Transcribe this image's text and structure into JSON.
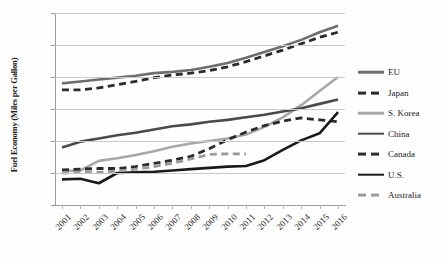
{
  "chart_data": {
    "type": "line",
    "title": "",
    "xlabel": "",
    "ylabel": "Fuel Economy (Miles per Gallon)",
    "x": [
      2001,
      2002,
      2003,
      2004,
      2005,
      2006,
      2007,
      2008,
      2009,
      2010,
      2011,
      2012,
      2013,
      2014,
      2015,
      2016
    ],
    "xticklabels": [
      "2001",
      "2002",
      "2003",
      "2004",
      "2005",
      "2006",
      "2007",
      "2008",
      "2009",
      "2010",
      "2011",
      "2012",
      "2013",
      "2014",
      "2015",
      "2016"
    ],
    "ylim": [
      20,
      50
    ],
    "yticks": [
      20,
      25,
      30,
      35,
      40,
      45,
      50
    ],
    "yticklabels": [
      "20",
      "25",
      "30",
      "35",
      "40",
      "45",
      "50"
    ],
    "grid": true,
    "legend_position": "right",
    "series": [
      {
        "name": "EU",
        "color": "#6e6e6e",
        "style": "solid",
        "width": 2.6,
        "values": [
          39.0,
          39.3,
          39.6,
          39.9,
          40.2,
          40.6,
          40.8,
          41.1,
          41.6,
          42.2,
          43.0,
          43.9,
          44.8,
          45.8,
          47.0,
          48.0
        ]
      },
      {
        "name": "Japan",
        "color": "#2b2b2b",
        "style": "dashed",
        "width": 2.8,
        "values": [
          38.0,
          38.0,
          38.3,
          38.8,
          39.3,
          39.9,
          40.3,
          40.6,
          41.0,
          41.6,
          42.4,
          43.3,
          44.2,
          45.2,
          46.2,
          47.0
        ]
      },
      {
        "name": "S. Korea",
        "color": "#a8a8a8",
        "style": "solid",
        "width": 2.6,
        "values": [
          25.3,
          25.4,
          26.9,
          27.3,
          27.8,
          28.4,
          29.1,
          29.6,
          30.0,
          30.4,
          31.0,
          32.2,
          33.7,
          35.6,
          37.8,
          40.0
        ]
      },
      {
        "name": "China",
        "color": "#4a4a4a",
        "style": "solid",
        "width": 2.6,
        "values": [
          29.0,
          29.9,
          30.4,
          30.9,
          31.3,
          31.8,
          32.3,
          32.6,
          33.0,
          33.3,
          33.7,
          34.1,
          34.6,
          35.1,
          35.8,
          36.5
        ]
      },
      {
        "name": "Canada",
        "color": "#2b2b2b",
        "style": "dashed",
        "width": 2.8,
        "values": [
          25.5,
          25.6,
          25.7,
          25.7,
          26.0,
          26.5,
          27.0,
          27.6,
          28.8,
          30.2,
          31.4,
          32.4,
          33.1,
          33.6,
          33.3,
          33.0
        ]
      },
      {
        "name": "U.S.",
        "color": "#1a1a1a",
        "style": "solid",
        "width": 2.6,
        "values": [
          24.0,
          24.1,
          23.4,
          25.0,
          25.1,
          25.2,
          25.4,
          25.6,
          25.8,
          26.0,
          26.1,
          27.0,
          28.6,
          30.1,
          31.2,
          34.5
        ]
      },
      {
        "name": "Australia",
        "color": "#9b9b9b",
        "style": "dashed",
        "width": 2.8,
        "values": [
          25.0,
          25.1,
          25.1,
          25.3,
          25.6,
          26.0,
          26.5,
          27.2,
          27.9,
          28.0,
          28.0,
          null,
          null,
          null,
          null,
          null
        ]
      }
    ]
  },
  "legend": {
    "items": [
      {
        "label": "EU"
      },
      {
        "label": "Japan"
      },
      {
        "label": "S. Korea"
      },
      {
        "label": "China"
      },
      {
        "label": "Canada"
      },
      {
        "label": "U.S."
      },
      {
        "label": "Australia"
      }
    ]
  },
  "caption": {
    "text": ""
  }
}
